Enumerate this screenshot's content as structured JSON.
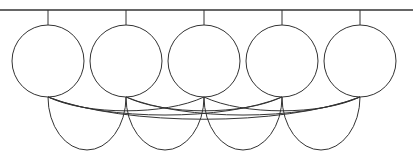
{
  "diagram": {
    "type": "network-of-circles",
    "stroke_color": "#333333",
    "background": "#ffffff",
    "top_bar": {
      "y": 10,
      "x1": 0,
      "x2": 413
    },
    "nodes": [
      {
        "id": "node-1",
        "cx": 48,
        "cy": 61,
        "r": 36
      },
      {
        "id": "node-2",
        "cx": 126,
        "cy": 61,
        "r": 36
      },
      {
        "id": "node-3",
        "cx": 204,
        "cy": 61,
        "r": 36
      },
      {
        "id": "node-4",
        "cx": 282,
        "cy": 61,
        "r": 36
      },
      {
        "id": "node-5",
        "cx": 360,
        "cy": 61,
        "r": 36
      }
    ],
    "lower_loops": [
      {
        "from": "node-1",
        "to": "node-2",
        "depth": 150
      },
      {
        "from": "node-2",
        "to": "node-3",
        "depth": 150
      },
      {
        "from": "node-3",
        "to": "node-4",
        "depth": 150
      },
      {
        "from": "node-4",
        "to": "node-5",
        "depth": 150
      }
    ],
    "connections": [
      {
        "from": "node-1",
        "to": "node-3"
      },
      {
        "from": "node-1",
        "to": "node-4"
      },
      {
        "from": "node-1",
        "to": "node-5"
      },
      {
        "from": "node-2",
        "to": "node-4"
      },
      {
        "from": "node-2",
        "to": "node-5"
      },
      {
        "from": "node-3",
        "to": "node-5"
      }
    ]
  }
}
